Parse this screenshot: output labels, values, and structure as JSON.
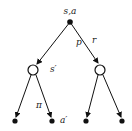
{
  "diagram": {
    "type": "backup-diagram",
    "colors": {
      "stroke": "#111111",
      "label": "#222222",
      "background": "#ffffff"
    },
    "nodes": [
      {
        "id": "root",
        "kind": "action",
        "shape": "filled-dot",
        "label": "s,a"
      },
      {
        "id": "state-left",
        "kind": "state",
        "shape": "open-circle",
        "label": "s′"
      },
      {
        "id": "state-right",
        "kind": "state",
        "shape": "open-circle",
        "label": ""
      },
      {
        "id": "leaf-1",
        "kind": "action",
        "shape": "filled-dot",
        "label": ""
      },
      {
        "id": "leaf-2",
        "kind": "action",
        "shape": "filled-dot",
        "label": "a′"
      },
      {
        "id": "leaf-3",
        "kind": "action",
        "shape": "filled-dot",
        "label": ""
      },
      {
        "id": "leaf-4",
        "kind": "action",
        "shape": "filled-dot",
        "label": ""
      }
    ],
    "edge_labels": {
      "p": "p",
      "r": "r",
      "pi": "π"
    },
    "labels": {
      "root": "s,a",
      "state_left": "s′",
      "leaf_2": "a′"
    }
  }
}
